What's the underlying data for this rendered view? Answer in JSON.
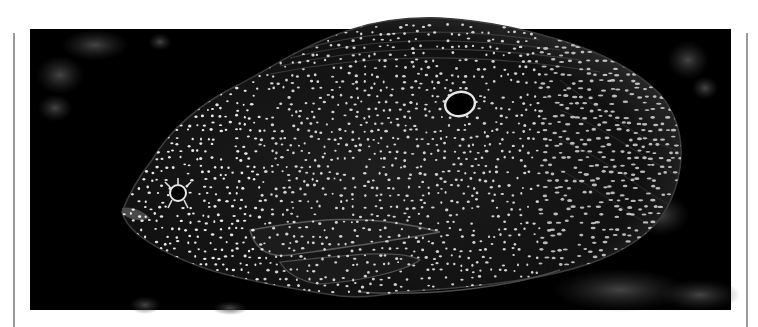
{
  "photo": {
    "subject": "Spotted coral grouper fish on dark reef background",
    "alt": "Close-up photograph of a dark fish covered in small white spots with a ringed eye-spot, swimming against a black background",
    "colors": {
      "background": "#000000",
      "fish_body": "#141414",
      "spots": "#f2f2f2",
      "reef": "#4a4a4a",
      "page": "#ffffff",
      "rule": "#9a9a9a"
    }
  }
}
